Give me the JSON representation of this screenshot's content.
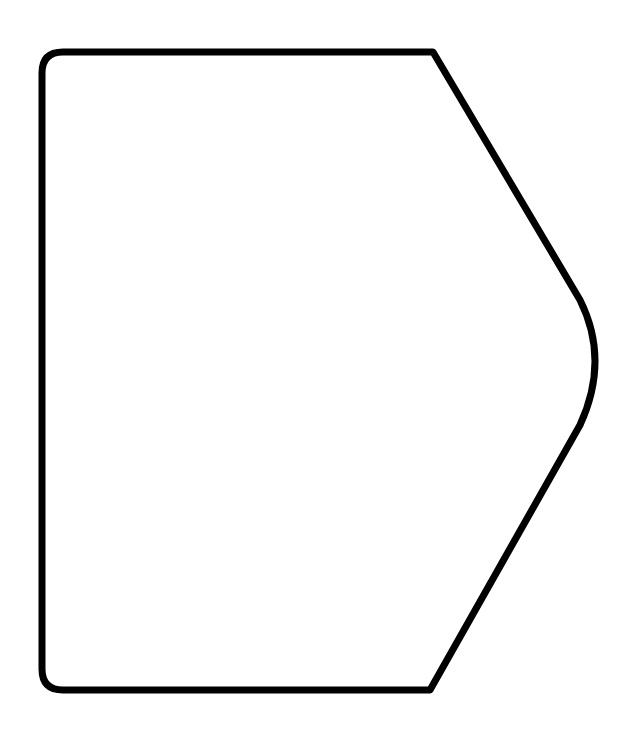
{
  "shape": {
    "type": "pentagon-with-rounded-corners",
    "stroke_color": "#000000",
    "fill_color": "#ffffff",
    "stroke_width": 7,
    "background": "#ffffff"
  }
}
